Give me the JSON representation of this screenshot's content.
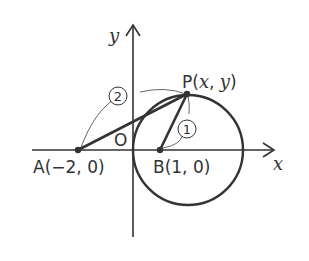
{
  "figure": {
    "axes": {
      "x_label": "x",
      "y_label": "y",
      "origin_label": "O"
    },
    "points": {
      "A": {
        "label": "A(−2, 0)"
      },
      "B": {
        "label": "B(1, 0)"
      },
      "P": {
        "label_prefix": "P(",
        "label_x": "x",
        "label_sep": ", ",
        "label_y": "y",
        "label_suffix": ")"
      }
    },
    "ratio_marks": {
      "AP": "2",
      "BP": "1"
    },
    "colors": {
      "ink": "#333333",
      "background": "#ffffff"
    }
  }
}
